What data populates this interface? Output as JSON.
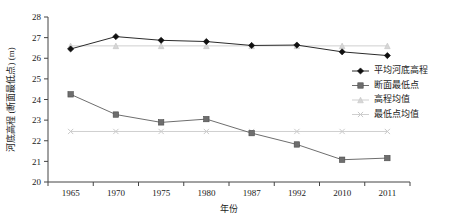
{
  "chart_data": {
    "type": "line",
    "title": "",
    "xlabel": "年份",
    "ylabel": "河底高程 (断面最低点) (m)",
    "categories": [
      "1965",
      "1970",
      "1975",
      "1980",
      "1987",
      "1992",
      "2010",
      "2011"
    ],
    "ylim": [
      20,
      28
    ],
    "yticks": [
      "20",
      "21",
      "22",
      "23",
      "24",
      "25",
      "26",
      "27",
      "28"
    ],
    "grid": false,
    "legend_position": "inside-right",
    "series": [
      {
        "name": "平均河底高程",
        "marker": "diamond",
        "color": "#101010",
        "values": [
          26.45,
          27.05,
          26.87,
          26.81,
          26.62,
          26.64,
          26.31,
          26.13
        ]
      },
      {
        "name": "断面最低点",
        "marker": "square",
        "color": "#6e6e6e",
        "values": [
          24.25,
          23.27,
          22.89,
          23.05,
          22.37,
          21.82,
          21.08,
          21.16
        ]
      },
      {
        "name": "高程均值",
        "marker": "triangle",
        "color": "#d6d6d6",
        "values": [
          26.6,
          26.6,
          26.6,
          26.6,
          26.6,
          26.6,
          26.6,
          26.6
        ]
      },
      {
        "name": "最低点均值",
        "marker": "x",
        "color": "#c9c9c9",
        "values": [
          22.45,
          22.45,
          22.45,
          22.45,
          22.45,
          22.45,
          22.45,
          22.45
        ]
      }
    ]
  },
  "legend": {
    "items": [
      {
        "label": "平均河底高程"
      },
      {
        "label": "断面最低点"
      },
      {
        "label": "高程均值"
      },
      {
        "label": "最低点均值"
      }
    ]
  }
}
